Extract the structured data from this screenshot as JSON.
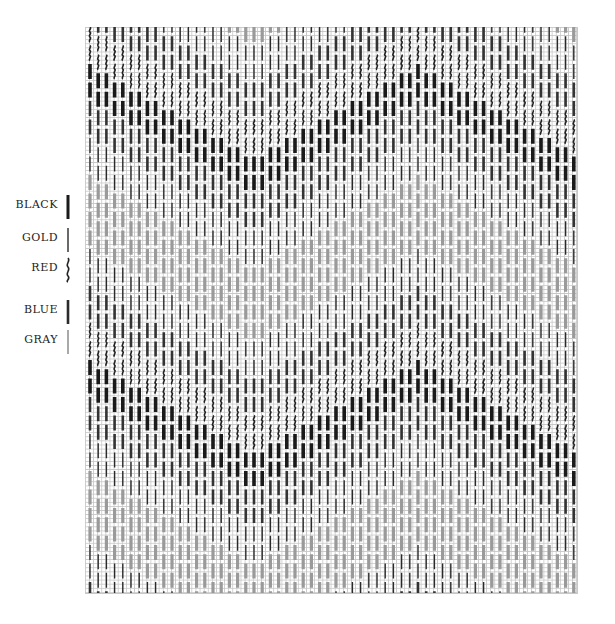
{
  "legend": {
    "items": [
      {
        "label": "BLACK",
        "key": "black",
        "color": "#1a1a1a",
        "style": "thick"
      },
      {
        "label": "GOLD",
        "key": "gold",
        "color": "#2a2a2a",
        "style": "thin"
      },
      {
        "label": "RED",
        "key": "red",
        "color": "#222222",
        "style": "wavy"
      },
      {
        "label": "BLUE",
        "key": "blue",
        "color": "#2b2b2b",
        "style": "medium"
      },
      {
        "label": "GRAY",
        "key": "gray",
        "color": "#555555",
        "style": "hairline"
      }
    ]
  },
  "chart": {
    "type": "bargello-stitch-chart",
    "grid": {
      "x": 85,
      "y": 27,
      "width": 492,
      "height": 566,
      "cell": 4.1
    },
    "columns": 60,
    "column_pitch": 8.2,
    "stitch_length_px": 15,
    "stitch_gap_px": 3.5,
    "vertical_period_rows": 4,
    "zigzag_period_columns": 40,
    "styles": {
      "black": {
        "width": 3.6,
        "color": "#1a1a1a"
      },
      "blue": {
        "width": 2.6,
        "color": "#333333"
      },
      "gold": {
        "width": 1.4,
        "color": "#2a2a2a"
      },
      "gray": {
        "width": 3.2,
        "color": "#9a9a9a"
      },
      "red": {
        "width": 1.6,
        "color": "#222222"
      }
    },
    "band_sequence": [
      "red",
      "black",
      "blue",
      "gold",
      "gray",
      "gray",
      "gold",
      "blue"
    ]
  }
}
